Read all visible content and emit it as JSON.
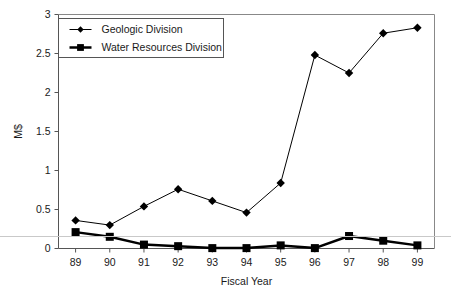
{
  "chart_data": {
    "type": "line",
    "title": "",
    "xlabel": "Fiscal Year",
    "ylabel": "M$",
    "categories": [
      "89",
      "90",
      "91",
      "92",
      "93",
      "94",
      "95",
      "96",
      "97",
      "98",
      "99"
    ],
    "series": [
      {
        "name": "Geologic Division",
        "marker": "diamond",
        "line_width": 1,
        "color": "#000000",
        "values": [
          0.36,
          0.3,
          0.54,
          0.76,
          0.61,
          0.46,
          0.84,
          2.48,
          2.25,
          2.76,
          2.83
        ]
      },
      {
        "name": "Water Resources Division",
        "marker": "square",
        "line_width": 2.5,
        "color": "#000000",
        "values": [
          0.21,
          0.15,
          0.05,
          0.03,
          0.005,
          0.005,
          0.04,
          0.005,
          0.16,
          0.1,
          0.04
        ]
      }
    ],
    "ylim": [
      0,
      3
    ],
    "yticks": [
      "0",
      "0.5",
      "1",
      "1.5",
      "2",
      "2.5",
      "3"
    ],
    "ytick_values": [
      0,
      0.5,
      1,
      1.5,
      2,
      2.5,
      3
    ],
    "grid": false,
    "legend_position": "top-left"
  },
  "axes": {
    "y_title": "M$",
    "x_title": "Fiscal Year"
  },
  "legend": {
    "entries": [
      {
        "label": "Geologic Division"
      },
      {
        "label": "Water Resources Division"
      }
    ]
  }
}
